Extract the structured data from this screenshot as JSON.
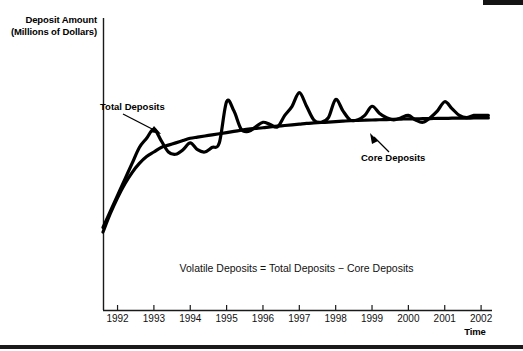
{
  "figure": {
    "y_axis_title_line1": "Deposit Amount",
    "y_axis_title_line2": "(Millions of Dollars)",
    "x_axis_title": "Time",
    "equation_note": "Volatile Deposits = Total Deposits − Core Deposits",
    "label_total_deposits": "Total Deposits",
    "label_core_deposits": "Core Deposits",
    "ink_color": "#000000",
    "background_color": "#ffffff"
  },
  "chart_data": {
    "type": "line",
    "title": "",
    "subtitle": "",
    "xlabel": "Time",
    "ylabel": "Deposit Amount (Millions of Dollars)",
    "grid": false,
    "legend_position": "inline-annotations",
    "annotations": [
      {
        "text": "Total Deposits",
        "target_series": "Total Deposits",
        "arrow": true
      },
      {
        "text": "Core Deposits",
        "target_series": "Core Deposits",
        "arrow": true
      },
      {
        "text": "Volatile Deposits = Total Deposits − Core Deposits",
        "arrow": false
      }
    ],
    "xticklabels": [
      "1992",
      "1993",
      "1994",
      "1995",
      "1996",
      "1997",
      "1998",
      "1999",
      "2000",
      "2001",
      "2002"
    ],
    "yticklabels": [],
    "ylim": [
      0,
      100
    ],
    "xlim": [
      1991.6,
      2002.3
    ],
    "x": [
      1991.6,
      1991.8,
      1992.0,
      1992.2,
      1992.4,
      1992.6,
      1992.8,
      1993.0,
      1993.2,
      1993.4,
      1993.6,
      1993.8,
      1994.0,
      1994.2,
      1994.4,
      1994.6,
      1994.8,
      1995.0,
      1995.2,
      1995.4,
      1995.6,
      1995.8,
      1996.0,
      1996.2,
      1996.4,
      1996.6,
      1996.8,
      1997.0,
      1997.2,
      1997.4,
      1997.6,
      1997.8,
      1998.0,
      1998.2,
      1998.4,
      1998.6,
      1998.8,
      1999.0,
      1999.2,
      1999.4,
      1999.6,
      1999.8,
      2000.0,
      2000.2,
      2000.4,
      2000.6,
      2000.8,
      2001.0,
      2001.2,
      2001.4,
      2001.6,
      2001.8,
      2002.0,
      2002.2
    ],
    "series": [
      {
        "name": "Total Deposits",
        "style": "oscillating",
        "values": [
          19,
          26,
          33,
          40,
          47,
          54,
          58,
          62,
          57,
          52,
          51,
          53,
          56,
          53,
          52,
          54,
          56,
          74,
          70,
          62,
          61,
          63,
          65,
          64,
          63,
          68,
          72,
          78,
          72,
          66,
          65,
          67,
          75,
          70,
          66,
          66,
          68,
          72,
          69,
          67,
          66,
          67,
          68,
          66,
          65,
          67,
          70,
          74,
          71,
          68,
          67,
          68,
          68,
          68
        ]
      },
      {
        "name": "Core Deposits",
        "style": "smooth-concave",
        "values": [
          17,
          25,
          32,
          38,
          43,
          47,
          50,
          52,
          54,
          55,
          56,
          57,
          58,
          58.5,
          59,
          59.5,
          60,
          60.5,
          61,
          61.5,
          62,
          62.3,
          62.6,
          63,
          63.3,
          63.6,
          63.9,
          64.2,
          64.5,
          64.7,
          64.9,
          65.1,
          65.3,
          65.5,
          65.7,
          65.8,
          65.9,
          66.0,
          66.1,
          66.2,
          66.3,
          66.4,
          66.5,
          66.5,
          66.6,
          66.6,
          66.7,
          66.7,
          66.8,
          66.8,
          66.8,
          66.9,
          66.9,
          66.9
        ]
      }
    ]
  }
}
